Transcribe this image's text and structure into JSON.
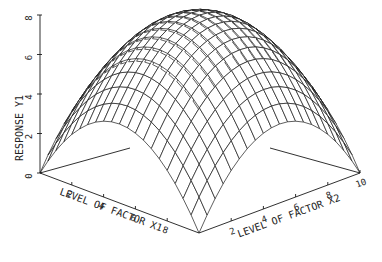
{
  "chart_data": {
    "type": "surface",
    "title": "",
    "xlabel": "LEVEL OF FACTOR X1",
    "ylabel": "LEVEL OF FACTOR X2",
    "zlabel": "RESPONSE Y1",
    "x_ticks": [
      "2",
      "4",
      "6",
      "8"
    ],
    "y_ticks": [
      "2",
      "4",
      "6",
      "8",
      "10"
    ],
    "z_ticks": [
      "0",
      "2",
      "4",
      "6",
      "8"
    ],
    "x_range": [
      0,
      10
    ],
    "y_range": [
      0,
      10
    ],
    "z_range": [
      0,
      8
    ],
    "grid_steps": 20,
    "model": "z = 8 - 0.16*((x1-5)^2 + (x2-5)^2)",
    "peak": {
      "x1": 5,
      "x2": 5,
      "y": 8
    },
    "corner_values": {
      "x1_0_x2_0": 0,
      "x1_10_x2_0": 0,
      "x1_0_x2_10": 0,
      "x1_10_x2_10": 0
    },
    "line_color": "#1a1a1a"
  }
}
